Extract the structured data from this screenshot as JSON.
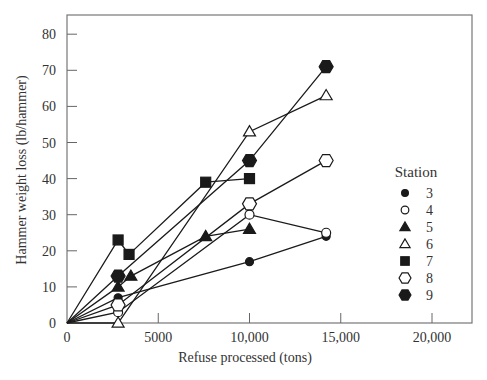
{
  "chart_data": {
    "type": "line",
    "title": "",
    "xlabel": "Refuse processed (tons)",
    "ylabel": "Hammer weight loss (lb/hammer)",
    "xlim": [
      0,
      22500
    ],
    "ylim": [
      0,
      85
    ],
    "x_ticks": [
      0,
      5000,
      10000,
      15000,
      20000
    ],
    "x_tick_labels": [
      "0",
      "5000",
      "10,000",
      "15,000",
      "20,000"
    ],
    "y_ticks": [
      0,
      10,
      20,
      30,
      40,
      50,
      60,
      70,
      80
    ],
    "y_tick_labels": [
      "0",
      "10",
      "20",
      "30",
      "40",
      "50",
      "60",
      "70",
      "80"
    ],
    "grid": false,
    "legend": {
      "title": "Station",
      "position": "right"
    },
    "series": [
      {
        "name": "3",
        "marker": "filled-circle",
        "points": [
          [
            0,
            0
          ],
          [
            2800,
            7
          ],
          [
            10000,
            17
          ],
          [
            14200,
            24
          ]
        ]
      },
      {
        "name": "4",
        "marker": "open-circle",
        "points": [
          [
            0,
            0
          ],
          [
            2800,
            3
          ],
          [
            10000,
            30
          ],
          [
            14200,
            25
          ]
        ]
      },
      {
        "name": "5",
        "marker": "filled-triangle",
        "points": [
          [
            0,
            0
          ],
          [
            2800,
            10
          ],
          [
            3500,
            13
          ],
          [
            7600,
            24
          ],
          [
            10000,
            26
          ]
        ]
      },
      {
        "name": "6",
        "marker": "open-triangle",
        "points": [
          [
            0,
            0
          ],
          [
            2800,
            0
          ],
          [
            10000,
            53
          ],
          [
            14200,
            63
          ]
        ]
      },
      {
        "name": "7",
        "marker": "filled-square",
        "points": [
          [
            0,
            0
          ],
          [
            2800,
            23
          ],
          [
            3400,
            19
          ],
          [
            7600,
            39
          ],
          [
            10000,
            40
          ]
        ]
      },
      {
        "name": "8",
        "marker": "open-hexagon",
        "points": [
          [
            0,
            0
          ],
          [
            2800,
            5
          ],
          [
            10000,
            33
          ],
          [
            14200,
            45
          ]
        ]
      },
      {
        "name": "9",
        "marker": "filled-hexagon",
        "points": [
          [
            0,
            0
          ],
          [
            2800,
            13
          ],
          [
            10000,
            45
          ],
          [
            14200,
            71
          ]
        ]
      }
    ]
  },
  "legend": {
    "title": "Station",
    "items": [
      {
        "label": "3",
        "marker": "filled-circle"
      },
      {
        "label": "4",
        "marker": "open-circle"
      },
      {
        "label": "5",
        "marker": "filled-triangle"
      },
      {
        "label": "6",
        "marker": "open-triangle"
      },
      {
        "label": "7",
        "marker": "filled-square"
      },
      {
        "label": "8",
        "marker": "open-hexagon"
      },
      {
        "label": "9",
        "marker": "filled-hexagon"
      }
    ]
  },
  "colors": {
    "ink": "#1a1a1a",
    "axis": "#555555",
    "background": "#ffffff"
  }
}
